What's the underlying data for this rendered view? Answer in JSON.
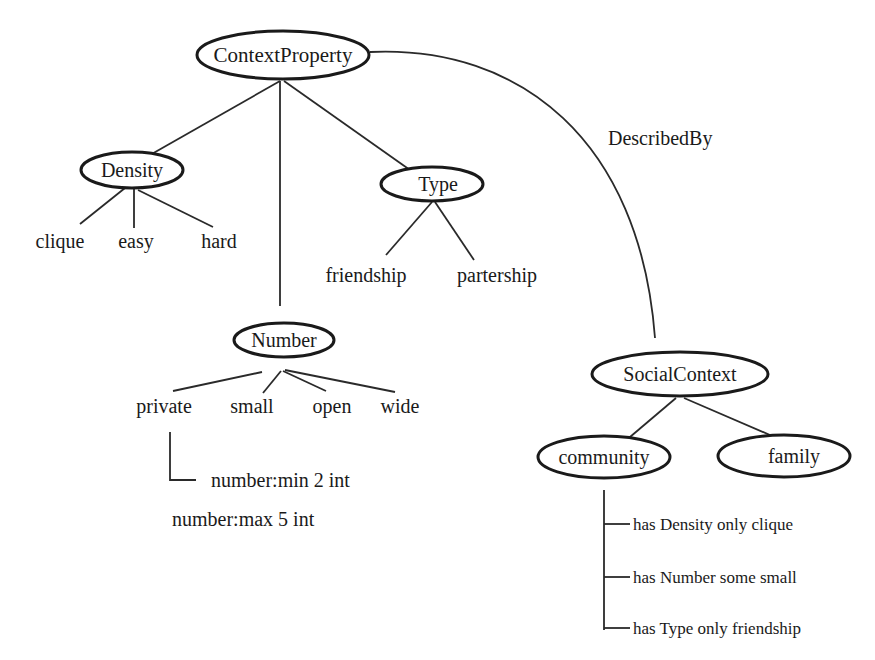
{
  "diagram": {
    "root": {
      "label": "ContextProperty"
    },
    "relation": {
      "label": "DescribedBy"
    },
    "density": {
      "label": "Density",
      "values": [
        "clique",
        "easy",
        "hard"
      ]
    },
    "type": {
      "label": "Type",
      "values": [
        "friendship",
        "partership"
      ]
    },
    "number": {
      "label": "Number",
      "values": [
        "private",
        "small",
        "open",
        "wide"
      ],
      "constraints": [
        "number:min 2 int",
        "number:max 5 int"
      ]
    },
    "social_context": {
      "label": "SocialContext",
      "children": [
        "community",
        "family"
      ],
      "community_restrictions": [
        "has Density only clique",
        "has Number some small",
        "has Type only friendship"
      ]
    }
  }
}
